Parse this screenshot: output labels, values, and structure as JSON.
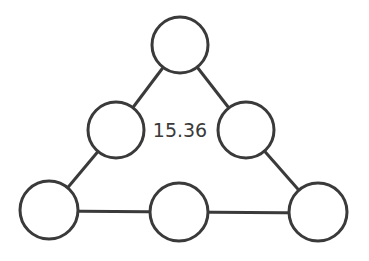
{
  "diagram": {
    "center_value": "15.36",
    "colors": {
      "stroke": "#3a3a3a",
      "fill": "#ffffff",
      "text": "#3a3a3a"
    },
    "nodes": [
      {
        "id": "top",
        "cx": 180,
        "cy": 45,
        "r": 28
      },
      {
        "id": "mid-left",
        "cx": 116,
        "cy": 130,
        "r": 28
      },
      {
        "id": "mid-right",
        "cx": 246,
        "cy": 130,
        "r": 28
      },
      {
        "id": "bottom-left",
        "cx": 49,
        "cy": 210,
        "r": 29
      },
      {
        "id": "bottom-middle",
        "cx": 179,
        "cy": 212,
        "r": 29
      },
      {
        "id": "bottom-right",
        "cx": 318,
        "cy": 212,
        "r": 29
      }
    ],
    "edges": [
      [
        "top",
        "mid-left"
      ],
      [
        "top",
        "mid-right"
      ],
      [
        "mid-left",
        "bottom-left"
      ],
      [
        "mid-right",
        "bottom-right"
      ],
      [
        "bottom-left",
        "bottom-middle"
      ],
      [
        "bottom-middle",
        "bottom-right"
      ]
    ]
  }
}
